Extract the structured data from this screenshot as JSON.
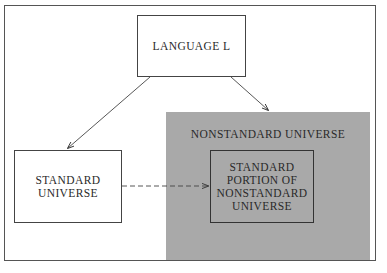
{
  "diagram": {
    "nodes": {
      "language": "LANGUAGE L",
      "standard_universe": [
        "STANDARD",
        "UNIVERSE"
      ],
      "nonstandard_universe": "NONSTANDARD UNIVERSE",
      "standard_portion": [
        "STANDARD",
        "PORTION OF",
        "NONSTANDARD",
        "UNIVERSE"
      ]
    },
    "edges": [
      {
        "from": "LANGUAGE L",
        "to": "STANDARD UNIVERSE",
        "style": "solid"
      },
      {
        "from": "LANGUAGE L",
        "to": "NONSTANDARD UNIVERSE",
        "style": "solid"
      },
      {
        "from": "STANDARD UNIVERSE",
        "to": "STANDARD PORTION OF NONSTANDARD UNIVERSE",
        "style": "dashed"
      }
    ],
    "colors": {
      "shade": "#a9a9a9",
      "line": "#444444"
    }
  }
}
